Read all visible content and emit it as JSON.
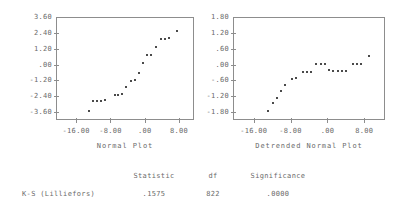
{
  "chart_data": [
    {
      "type": "scatter",
      "title": "",
      "xlabel": "Normal Plot",
      "ylabel": "",
      "xlim": [
        -20.7,
        11.5
      ],
      "ylim": [
        -4.2,
        3.6
      ],
      "xticks": [
        "-16.00",
        "-8.00",
        ".00",
        "8.00"
      ],
      "xtickvals": [
        -16,
        -8,
        0,
        8
      ],
      "yticks": [
        "3.60",
        "2.40",
        "1.20",
        ".00",
        "-1.20",
        "-2.40",
        "-3.60"
      ],
      "ytickvals": [
        3.6,
        2.4,
        1.2,
        0,
        -1.2,
        -2.4,
        -3.6
      ],
      "grid": false,
      "legend": "none",
      "points": [
        [
          -13.2,
          -3.45
        ],
        [
          -12.2,
          -2.72
        ],
        [
          -11.3,
          -2.68
        ],
        [
          -10.4,
          -2.66
        ],
        [
          -9.5,
          -2.64
        ],
        [
          -7.2,
          -2.22
        ],
        [
          -6.4,
          -2.2
        ],
        [
          -5.6,
          -2.18
        ],
        [
          -4.6,
          -1.62
        ],
        [
          -3.5,
          -1.14
        ],
        [
          -2.6,
          -1.12
        ],
        [
          -1.6,
          -0.55
        ],
        [
          -0.7,
          0.18
        ],
        [
          0.4,
          0.78
        ],
        [
          1.3,
          0.8
        ],
        [
          2.3,
          1.42
        ],
        [
          3.5,
          2.02
        ],
        [
          4.5,
          2.04
        ],
        [
          5.5,
          2.05
        ],
        [
          7.2,
          2.62
        ]
      ]
    },
    {
      "type": "scatter",
      "title": "",
      "xlabel": "Detrended Normal Plot",
      "ylabel": "",
      "xlim": [
        -20.5,
        12.5
      ],
      "ylim": [
        -2.1,
        1.8
      ],
      "xticks": [
        "-16.00",
        "-8.00",
        ".00",
        "8.00"
      ],
      "xtickvals": [
        -16,
        -8,
        0,
        8
      ],
      "yticks": [
        "1.80",
        "1.20",
        ".60",
        ".00",
        "-.60",
        "-1.20",
        "-1.80"
      ],
      "ytickvals": [
        1.8,
        1.2,
        0.6,
        0,
        -0.6,
        -1.2,
        -1.8
      ],
      "grid": false,
      "legend": "none",
      "points": [
        [
          -13.2,
          -1.72
        ],
        [
          -12.1,
          -1.42
        ],
        [
          -11.2,
          -1.22
        ],
        [
          -10.3,
          -0.96
        ],
        [
          -9.4,
          -0.72
        ],
        [
          -8.0,
          -0.5
        ],
        [
          -7.0,
          -0.48
        ],
        [
          -5.6,
          -0.26
        ],
        [
          -4.7,
          -0.25
        ],
        [
          -3.8,
          -0.24
        ],
        [
          -2.6,
          0.04
        ],
        [
          -1.7,
          0.05
        ],
        [
          -0.8,
          0.05
        ],
        [
          0.2,
          -0.18
        ],
        [
          1.1,
          -0.19
        ],
        [
          2.0,
          -0.19
        ],
        [
          2.9,
          -0.19
        ],
        [
          3.8,
          -0.19
        ],
        [
          5.3,
          0.04
        ],
        [
          6.2,
          0.04
        ],
        [
          7.1,
          0.04
        ],
        [
          8.8,
          0.38
        ]
      ]
    }
  ],
  "plots": {
    "normal": {
      "axis_title": "Normal Plot"
    },
    "detrended": {
      "axis_title": "Detrended Normal Plot"
    }
  },
  "stats_table": {
    "headers": {
      "label": "",
      "statistic": "Statistic",
      "df": "df",
      "significance": "Significance"
    },
    "rows": [
      {
        "label": "K-S (Lilliefors)",
        "statistic": ".1575",
        "df": "822",
        "significance": ".0000"
      }
    ]
  },
  "colors": {
    "frame": "#8d8d8d",
    "text": "#6a6a6a",
    "point": "#4a4a4a",
    "background": "#ffffff"
  }
}
